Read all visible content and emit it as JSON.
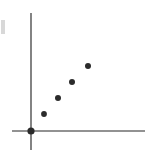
{
  "figure": {
    "width": 158,
    "height": 157,
    "background_color": "#ffffff",
    "caption": "",
    "scan_artifact_color": "#d8d8d8"
  },
  "chart_data": {
    "type": "scatter",
    "title": "",
    "subtitle": "",
    "xlabel": "",
    "ylabel": "",
    "xlim": [
      0,
      10
    ],
    "ylim": [
      0,
      10
    ],
    "grid": false,
    "legend": null,
    "legend_position": "none",
    "tick_labels_x": [],
    "tick_labels_y": [],
    "annotations": [],
    "marker_style": "filled-circle",
    "marker_color": "#2b2b2b",
    "axis_color": "#6e6e6e",
    "series": [
      {
        "name": "observations",
        "color": "#2b2b2b",
        "x": [
          0.0,
          1.2,
          2.4,
          3.6,
          4.8
        ],
        "y": [
          0.0,
          1.8,
          3.4,
          4.9,
          6.3
        ]
      }
    ],
    "point_pixels": [
      {
        "cx": 31,
        "cy": 131,
        "r": 3.6,
        "label": "origin-point"
      },
      {
        "cx": 44,
        "cy": 114,
        "r": 2.9,
        "label": "point-1"
      },
      {
        "cx": 58,
        "cy": 98,
        "r": 3.0,
        "label": "point-2"
      },
      {
        "cx": 72,
        "cy": 82,
        "r": 3.0,
        "label": "point-3"
      },
      {
        "cx": 88,
        "cy": 66,
        "r": 3.0,
        "label": "point-4"
      }
    ],
    "axes_pixels": {
      "y_axis": {
        "x": 31,
        "y_top": 13,
        "y_bottom": 150,
        "width": 1.7
      },
      "x_axis": {
        "y": 131,
        "x_left": 12,
        "x_right": 145,
        "width": 1.7
      }
    }
  }
}
